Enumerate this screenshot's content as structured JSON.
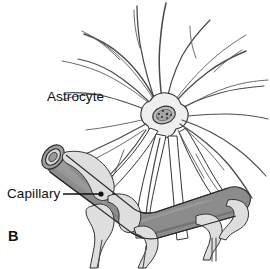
{
  "figure": {
    "panel_label": "B",
    "kind": "anatomical-line-drawing",
    "background_color": "#ffffff",
    "width": 270,
    "height": 269,
    "labels": [
      {
        "id": "astrocyte",
        "text": "Astrocyte",
        "has_leader_line": false
      },
      {
        "id": "capillary",
        "text": "Capillary",
        "has_leader_line": true
      }
    ],
    "structures": [
      {
        "id": "astrocyte-soma",
        "name": "Astrocyte cell body",
        "fill_color": "#eeeeee",
        "outline_color": "#3a3a3a"
      },
      {
        "id": "astrocyte-nucleus",
        "name": "Nucleus with chromatin speckles",
        "fill_color": "#b9b9b9",
        "outline_color": "#2e2e2e"
      },
      {
        "id": "astrocyte-processes",
        "name": "Radiating astrocytic processes",
        "outline_color": "#4a4a4a",
        "count": 22
      },
      {
        "id": "capillary",
        "name": "Capillary blood vessel",
        "fill_color": "#8c8c8c",
        "outline_color": "#2b2b2b"
      },
      {
        "id": "capillary-lumen",
        "name": "Cut end lumen of capillary",
        "fill_color": "#d8d8d8",
        "outline_color": "#2b2b2b"
      },
      {
        "id": "endfeet",
        "name": "Perivascular astrocyte endfeet",
        "fill_color": "#dedede",
        "outline_color": "#333333"
      }
    ],
    "colors": {
      "ink": "#111111",
      "line": "#3a3a3a",
      "vessel_gray": "#8c8c8c",
      "vessel_dark": "#6f6f6f",
      "endfoot_gray": "#dedede",
      "soma_gray": "#eeeeee",
      "nucleus_gray": "#b9b9b9"
    }
  }
}
